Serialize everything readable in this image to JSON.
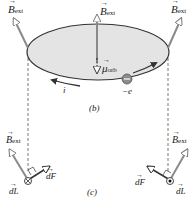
{
  "diagram": {
    "panels": [
      {
        "id": "b",
        "label": "(b)"
      },
      {
        "id": "c",
        "label": "(c)"
      }
    ],
    "labels": {
      "b_ext_left": {
        "symbol": "B",
        "subscript": "ext"
      },
      "b_ext_center": {
        "symbol": "B",
        "subscript": "ext"
      },
      "b_ext_right": {
        "symbol": "B",
        "subscript": "ext"
      },
      "mu_orb": {
        "symbol": "μ",
        "subscript": "orb"
      },
      "current": "i",
      "charge": "−e",
      "b_ext_c_left": {
        "symbol": "B",
        "subscript": "ext"
      },
      "b_ext_c_right": {
        "symbol": "B",
        "subscript": "ext"
      },
      "dF_left": "dF",
      "dL_left": "dL",
      "dF_right": "dF",
      "dL_right": "dL"
    },
    "colors": {
      "ellipse_fill": "#e4e4e4",
      "ellipse_stroke": "#333333",
      "field_arrow": "#8a8a8a",
      "dark_arrow": "#333333",
      "electron": "#8c8c8c"
    }
  }
}
